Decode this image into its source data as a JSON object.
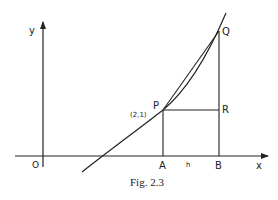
{
  "figure": {
    "caption": "Fig. 2.3",
    "axes": {
      "x_label": "x",
      "y_label": "y",
      "origin_label": "O"
    },
    "points": {
      "P": {
        "label": "P",
        "coord_label": "(2,1)"
      },
      "Q": {
        "label": "Q"
      },
      "R": {
        "label": "R"
      },
      "A": {
        "label": "A"
      },
      "B": {
        "label": "B"
      }
    },
    "increment_label": "h",
    "colors": {
      "ink": "#222222",
      "background": "#ffffff"
    }
  }
}
